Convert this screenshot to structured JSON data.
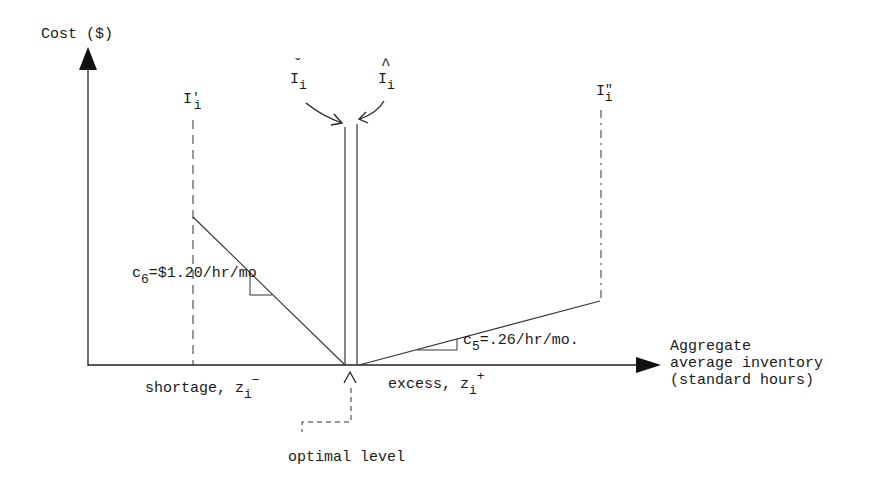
{
  "diagram": {
    "y_axis_label": "Cost ($)",
    "x_axis_label_lines": [
      "Aggregate",
      "average inventory",
      "(standard hours)"
    ],
    "markers": {
      "i_prime": {
        "base": "I",
        "prime": "'",
        "sub": "i"
      },
      "i_check": {
        "accent": "ˇ",
        "base": "I",
        "sub": "i"
      },
      "i_hat": {
        "accent": "^",
        "base": "I",
        "sub": "i"
      },
      "i_double_prime": {
        "base": "I",
        "prime": "\"",
        "sub": "i"
      }
    },
    "slopes": {
      "shortage": {
        "sym": "c",
        "sub": "6",
        "value": "=$1.20/hr/mo"
      },
      "excess": {
        "sym": "c",
        "sub": "5",
        "value": "=.26/hr/mo."
      }
    },
    "regions": {
      "shortage": {
        "text": "shortage, ",
        "var": "z",
        "sub": "i",
        "sup": "−"
      },
      "excess": {
        "text": "excess, ",
        "var": "z",
        "sub": "i",
        "sup": "+"
      }
    },
    "optimal_label": "optimal level",
    "optimal_marker": "∧",
    "colors": {
      "ink": "#1a1a1a",
      "background": "#ffffff"
    }
  }
}
